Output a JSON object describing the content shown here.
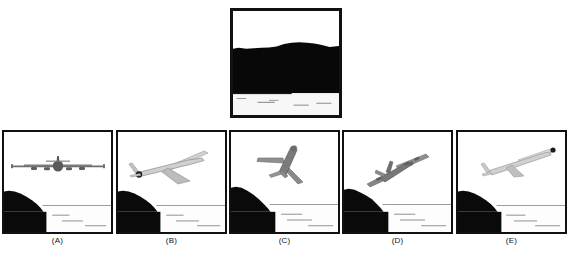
{
  "figure": {
    "type": "multiple-choice-image-figure",
    "background_color": "#ffffff",
    "ink_color": "#111111",
    "panel_count": 6
  },
  "reference": {
    "name": "reference-scene",
    "caption": "",
    "description": "Close-up photograph of a dark hillside mass filling most of the frame with a white sky band above and a pale water strip with wave streaks below",
    "sky_color": "#ffffff",
    "land_color": "#080808",
    "water_color": "#f7f7f7",
    "horizon_y_percent": 78
  },
  "options": [
    {
      "id": "A",
      "label": "(A)",
      "name": "option-panel-a",
      "aircraft_view": "head-on front view, wings level",
      "aircraft_rotation_deg": 0,
      "aircraft_color": "#6e6e6e",
      "engine_count": 4,
      "sky_color": "#ffffff",
      "land_color": "#0a0a0a",
      "water_color": "#fdfdfd",
      "has_sun": false
    },
    {
      "id": "B",
      "label": "(B)",
      "name": "option-panel-b",
      "aircraft_view": "rear three-quarter, climbing and banking left",
      "aircraft_rotation_deg": -18,
      "aircraft_color": "#8a8a8a",
      "engine_count": 2,
      "sky_color": "#ffffff",
      "land_color": "#0a0a0a",
      "water_color": "#fdfdfd",
      "has_sun": true
    },
    {
      "id": "C",
      "label": "(C)",
      "name": "option-panel-c",
      "aircraft_view": "belly view, nose up and to the right, steep climb",
      "aircraft_rotation_deg": -52,
      "aircraft_color": "#6b6b6b",
      "engine_count": 2,
      "sky_color": "#ffffff",
      "land_color": "#0a0a0a",
      "water_color": "#fdfdfd",
      "has_sun": false
    },
    {
      "id": "D",
      "label": "(D)",
      "name": "option-panel-d",
      "aircraft_view": "front three-quarter, banking and descending to the left",
      "aircraft_rotation_deg": 28,
      "aircraft_color": "#6f6f6f",
      "engine_count": 4,
      "sky_color": "#ffffff",
      "land_color": "#0a0a0a",
      "water_color": "#fdfdfd",
      "has_sun": false
    },
    {
      "id": "E",
      "label": "(E)",
      "name": "option-panel-e",
      "aircraft_view": "side view, nose up to the right, shallow climb",
      "aircraft_rotation_deg": -16,
      "aircraft_color": "#9a9a9a",
      "engine_count": 2,
      "sky_color": "#ffffff",
      "land_color": "#0a0a0a",
      "water_color": "#fdfdfd",
      "has_sun": true
    }
  ]
}
